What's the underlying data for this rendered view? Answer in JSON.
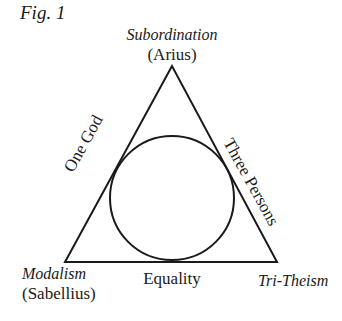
{
  "figure": {
    "label": "Fig. 1",
    "vertices": {
      "top": {
        "title": "Subordination",
        "subtitle": "(Arius)"
      },
      "bottom_left": {
        "title": "Modalism",
        "subtitle": "(Sabellius)"
      },
      "bottom_right": {
        "title": "Tri-Theism"
      }
    },
    "sides": {
      "left": "One God",
      "right": "Three Persons",
      "bottom": "Equality"
    },
    "colors": {
      "line": "#1a1a1a",
      "background": "#ffffff"
    }
  }
}
